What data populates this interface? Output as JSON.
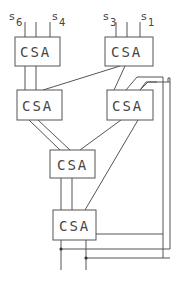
{
  "diagram": {
    "type": "carry-save adder tree",
    "nodes": [
      {
        "id": "csa1",
        "label": "CSA",
        "inputs": [
          "s6",
          "",
          "s4"
        ]
      },
      {
        "id": "csa2",
        "label": "CSA",
        "inputs": [
          "s3",
          "",
          "s1"
        ]
      },
      {
        "id": "csa3",
        "label": "CSA"
      },
      {
        "id": "csa4",
        "label": "CSA"
      },
      {
        "id": "csa5",
        "label": "CSA"
      },
      {
        "id": "csa6",
        "label": "CSA"
      }
    ],
    "input_labels": {
      "s6": {
        "base": "s",
        "sub": "6"
      },
      "s4": {
        "base": "s",
        "sub": "4"
      },
      "s3": {
        "base": "s",
        "sub": "3"
      },
      "s1": {
        "base": "s",
        "sub": "1"
      }
    },
    "edges": [
      [
        "csa1",
        "csa3"
      ],
      [
        "csa1",
        "csa3"
      ],
      [
        "csa2",
        "csa3"
      ],
      [
        "csa2",
        "csa4"
      ],
      [
        "csa3",
        "csa5"
      ],
      [
        "csa3",
        "csa5"
      ],
      [
        "csa4",
        "csa5"
      ],
      [
        "csa4",
        "csa6"
      ],
      [
        "csa5",
        "csa6"
      ],
      [
        "csa5",
        "csa6"
      ],
      [
        "csa6",
        "csa4",
        "feedback"
      ],
      [
        "csa6",
        "csa4",
        "feedback"
      ]
    ]
  }
}
